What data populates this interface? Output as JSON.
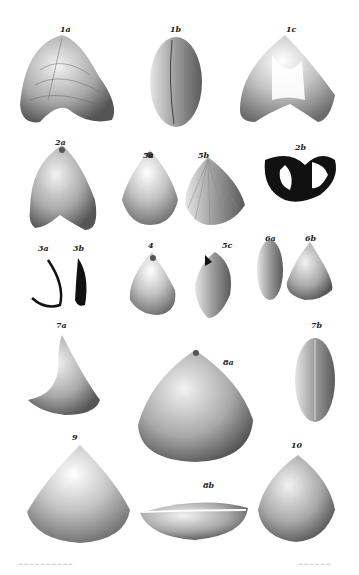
{
  "plate": {
    "figures": [
      {
        "id": "1a",
        "label": "1a"
      },
      {
        "id": "1b",
        "label": "1b"
      },
      {
        "id": "1c",
        "label": "1c"
      },
      {
        "id": "2a",
        "label": "2a"
      },
      {
        "id": "3a",
        "label": "3a"
      },
      {
        "id": "3b",
        "label": "3b"
      },
      {
        "id": "2b",
        "label": "2b"
      },
      {
        "id": "5a",
        "label": "5a"
      },
      {
        "id": "5b",
        "label": "5b"
      },
      {
        "id": "4",
        "label": "4"
      },
      {
        "id": "5c",
        "label": "5c"
      },
      {
        "id": "6a",
        "label": "6a"
      },
      {
        "id": "6b",
        "label": "6b"
      },
      {
        "id": "7a",
        "label": "7a"
      },
      {
        "id": "8a",
        "label": "8a"
      },
      {
        "id": "7b",
        "label": "7b"
      },
      {
        "id": "9",
        "label": "9"
      },
      {
        "id": "8b",
        "label": "8b"
      },
      {
        "id": "10",
        "label": "10"
      }
    ],
    "footer_left": "~~~~~~~~~~",
    "footer_right": "~~~~~~"
  }
}
